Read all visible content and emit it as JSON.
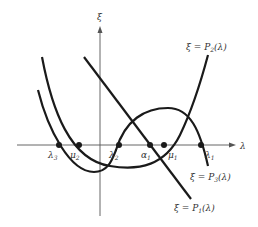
{
  "axes": {
    "vertical_label": "ξ",
    "horizontal_label": "λ"
  },
  "curves": [
    {
      "name": "P1",
      "label": "ξ = P₁(λ)",
      "label_main": "ξ = P",
      "label_sub": "1",
      "label_tail": "(λ)"
    },
    {
      "name": "P2",
      "label": "ξ = P₂(λ)",
      "label_main": "ξ = P",
      "label_sub": "2",
      "label_tail": "(λ)"
    },
    {
      "name": "P3",
      "label": "ξ = P₃(λ)",
      "label_main": "ξ = P",
      "label_sub": "3",
      "label_tail": "(λ)"
    }
  ],
  "points": [
    {
      "main": "λ",
      "sub": "3"
    },
    {
      "main": "μ",
      "sub": "2"
    },
    {
      "main": "λ",
      "sub": "2"
    },
    {
      "main": "α",
      "sub": "1"
    },
    {
      "main": "μ",
      "sub": "1"
    },
    {
      "main": "λ",
      "sub": "1"
    }
  ],
  "colors": {
    "ink": "#1a1a1a",
    "axis": "#444444"
  }
}
